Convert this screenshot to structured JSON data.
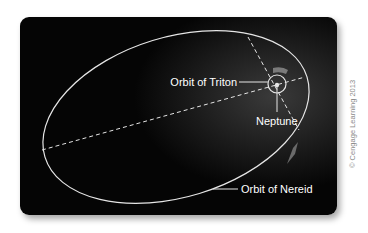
{
  "diagram": {
    "labels": {
      "triton": "Orbit of Triton",
      "neptune": "Neptune",
      "nereid": "Orbit of Nereid"
    },
    "credit": "© Cengage Learning 2013",
    "colors": {
      "background": "#ffffff",
      "card": "#0a0a0a",
      "lines": "#e6e6e6",
      "arrows": "#7a7a7a",
      "credit_text": "#8a8a8a"
    }
  }
}
